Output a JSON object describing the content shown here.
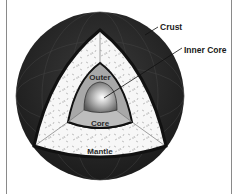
{
  "diagram": {
    "labels": {
      "crust": "Crust",
      "inner_core": "Inner Core",
      "outer": "Outer",
      "core": "Core",
      "mantle": "Mantle"
    },
    "colors": {
      "crust": "#262626",
      "mantle": "#f7f7f7",
      "outer_core": "#a8a8a8",
      "inner_core": "#8c8c8c",
      "outline": "#111111",
      "frame": "#8a8a8a"
    }
  }
}
